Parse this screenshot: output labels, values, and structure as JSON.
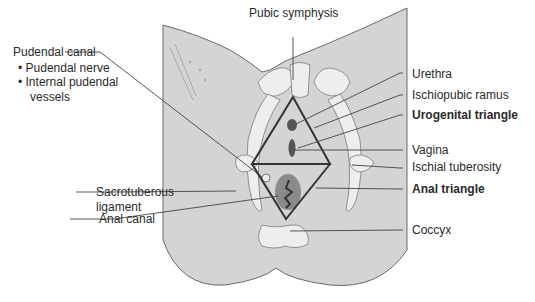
{
  "diagram": {
    "colors": {
      "skin": "#d4d4d4",
      "bone": "#eeeeee",
      "outline": "#6a6a6a",
      "triangle": "#333333",
      "organ_dark": "#555555",
      "anal_region": "#8a8a8a",
      "leader": "#444444"
    },
    "labels": {
      "pubic_symphysis": "Pubic symphysis",
      "pudendal_canal": "Pudendal canal",
      "pudendal_nerve": "• Pudendal nerve",
      "internal_pudendal_1": "• Internal pudendal",
      "internal_pudendal_2": "vessels",
      "sacrotuberous_1": "Sacrotuberous",
      "sacrotuberous_2": "ligament",
      "anal_canal": "Anal canal",
      "urethra": "Urethra",
      "ischiopubic_ramus": "Ischiopubic ramus",
      "urogenital_triangle": "Urogenital triangle",
      "vagina": "Vagina",
      "ischial_tuberosity": "Ischial tuberosity",
      "anal_triangle": "Anal triangle",
      "coccyx": "Coccyx"
    }
  }
}
